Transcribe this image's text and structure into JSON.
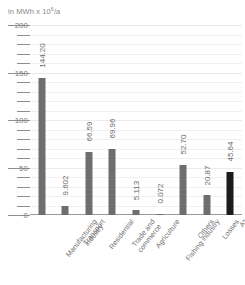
{
  "chart_data": {
    "type": "bar",
    "title": "",
    "subtitle": "",
    "xlabel": "",
    "ylabel": "in MWh x 10⁶/a",
    "ylabel_prefix": "in MWh x 10",
    "ylabel_exponent": "6",
    "ylabel_suffix": "/a",
    "ylim": [
      0,
      200
    ],
    "ytick_step_major": 50,
    "ytick_step_minor": 10,
    "ytick_labels": [
      "200",
      "150",
      "100",
      "50",
      "0"
    ],
    "ytick_values": [
      200,
      150,
      100,
      50,
      0
    ],
    "grid": true,
    "grid_orientation": "horizontal",
    "legend": "none",
    "categories": [
      "Manufacturing industry",
      "Transport",
      "Residential",
      "Trade and commerce",
      "Agriculture",
      "Fishing industry",
      "Others",
      "Losses",
      "A*"
    ],
    "category_lines": [
      [
        "Manufacturing",
        "industry"
      ],
      [
        "Transport"
      ],
      [
        "Residential"
      ],
      [
        "Trade and",
        "commerce"
      ],
      [
        "Agriculture"
      ],
      [
        "Fishing industry"
      ],
      [
        "Others"
      ],
      [
        "Losses"
      ],
      [
        "A*"
      ]
    ],
    "values": [
      144.2,
      9.602,
      66.59,
      69.96,
      5.113,
      0.072,
      52.7,
      20.87,
      45.64
    ],
    "value_labels": [
      "144.20",
      "9.602",
      "66.59",
      "69.96",
      "5.113",
      "0.072",
      "52.70",
      "20.87",
      "45.64"
    ],
    "bar_colors": [
      "#6e6e6e",
      "#6e6e6e",
      "#6e6e6e",
      "#6e6e6e",
      "#6e6e6e",
      "#6e6e6e",
      "#6e6e6e",
      "#6e6e6e",
      "#1b1b1b"
    ],
    "accent_color": "#1b1b1b",
    "bar_color": "#6e6e6e",
    "grid_color": "#f0f0f0",
    "axis_color": "#8f8f8f",
    "text_color": "#6f6f6f"
  }
}
